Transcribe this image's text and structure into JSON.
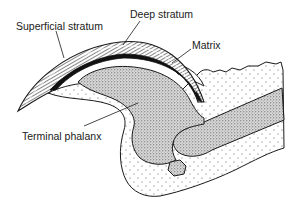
{
  "diagram": {
    "labels": {
      "superficial_stratum": "Superficial stratum",
      "deep_stratum": "Deep stratum",
      "matrix": "Matrix",
      "terminal_phalanx": "Terminal phalanx"
    },
    "colors": {
      "ink": "#1a1a1a",
      "background": "#ffffff",
      "bone_stipple": "#555555",
      "tissue_dots": "#444444"
    }
  }
}
